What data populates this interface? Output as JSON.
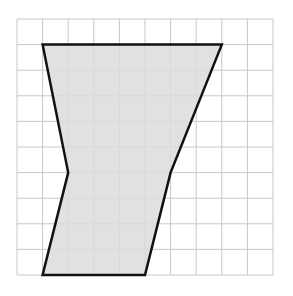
{
  "diagram": {
    "type": "polygon-on-grid",
    "grid": {
      "columns": 10,
      "rows": 10,
      "origin_px": [
        17,
        19
      ],
      "cell_px": 25.6,
      "line_color": "#c8c8c8"
    },
    "polygon": {
      "vertices_grid": [
        [
          1,
          1
        ],
        [
          8,
          1
        ],
        [
          6,
          6
        ],
        [
          5,
          10
        ],
        [
          1,
          10
        ],
        [
          2,
          6
        ]
      ],
      "fill_color": "#dcdcdc",
      "stroke_color": "#111111",
      "stroke_width": 2.5
    }
  }
}
